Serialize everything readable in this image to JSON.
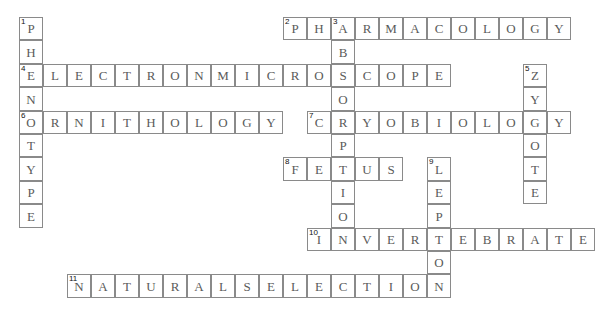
{
  "puzzle": {
    "type": "crossword",
    "grid_origin": {
      "x": 19,
      "y": 17
    },
    "cell_size": {
      "w": 24,
      "h": 23.4
    },
    "colors": {
      "border": "#8a8a8a",
      "letter": "#5a5a5a",
      "number": "#111111",
      "background": "#ffffff"
    },
    "words": [
      {
        "number": "1",
        "direction": "down",
        "answer": "PHENOTYPE",
        "row": 0,
        "col": 0
      },
      {
        "number": "2",
        "direction": "across",
        "answer": "PHARMACOLOGY",
        "row": 0,
        "col": 11
      },
      {
        "number": "3",
        "direction": "down",
        "answer": "ABSORPTION",
        "row": 0,
        "col": 13
      },
      {
        "number": "4",
        "direction": "across",
        "answer": "ELECTRONMICROSCOPE",
        "row": 2,
        "col": 0
      },
      {
        "number": "5",
        "direction": "down",
        "answer": "ZYGOTE",
        "row": 2,
        "col": 21
      },
      {
        "number": "6",
        "direction": "across",
        "answer": "ORNITHOLOGY",
        "row": 4,
        "col": 0
      },
      {
        "number": "7",
        "direction": "across",
        "answer": "CRYOBIOLOGY",
        "row": 4,
        "col": 12
      },
      {
        "number": "8",
        "direction": "across",
        "answer": "FETUS",
        "row": 6,
        "col": 11
      },
      {
        "number": "9",
        "direction": "down",
        "answer": "LEPTON",
        "row": 6,
        "col": 17
      },
      {
        "number": "10",
        "direction": "across",
        "answer": "INVERTEBRATE",
        "row": 9,
        "col": 12
      },
      {
        "number": "11",
        "direction": "across",
        "answer": "NATURALSELECTION",
        "row": 11,
        "col": 2
      }
    ]
  }
}
